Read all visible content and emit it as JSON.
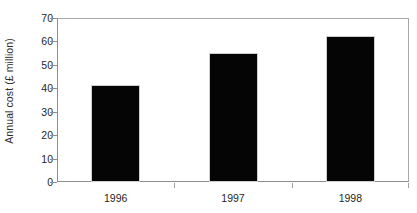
{
  "chart_data": {
    "type": "bar",
    "title": "",
    "xlabel": "",
    "ylabel": "Annual cost (£ million)",
    "categories": [
      "1996",
      "1997",
      "1998"
    ],
    "values": [
      41.5,
      55,
      62.5
    ],
    "ylim": [
      0,
      70
    ],
    "ytick_step": 10,
    "yticks": [
      70,
      60,
      50,
      40,
      30,
      20,
      10,
      0
    ],
    "ytick_labels": [
      "70",
      "60",
      "50",
      "40",
      "30",
      "20",
      "10",
      "0"
    ],
    "grid": false,
    "legend": null,
    "bar_color": "#050505",
    "bar_edge_color": "#cfcfcf",
    "axis_color": "#8d8d8d",
    "background": "#ffffff"
  }
}
